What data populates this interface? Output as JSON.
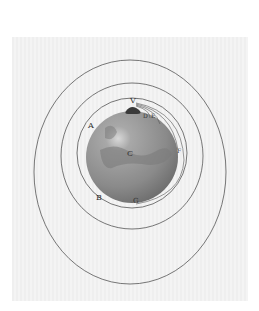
{
  "figure": {
    "labels": {
      "V": "V",
      "D": "D",
      "E": "E",
      "A": "A",
      "C": "C",
      "F": "F",
      "B": "B",
      "G": "G"
    },
    "colors": {
      "plate": "#f1f1f1",
      "globe": "#8a8a8a",
      "orbit_lines": "#555555",
      "mountain": "#3a3a3a"
    }
  }
}
